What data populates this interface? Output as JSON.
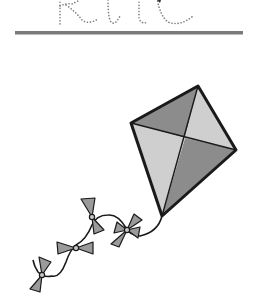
{
  "worksheet": {
    "trace_word": "kite",
    "baseline_color": "#7a7a7a",
    "dot_color": "#7d7d7d"
  },
  "illustration": {
    "subject": "kite",
    "colors": {
      "outline": "#1a1a1a",
      "dark_panel": "#8c8c8c",
      "light_panel": "#cfcfcf",
      "bow": "#9a9a9a",
      "knot": "#c8c8c8"
    },
    "bows_count": 4
  }
}
